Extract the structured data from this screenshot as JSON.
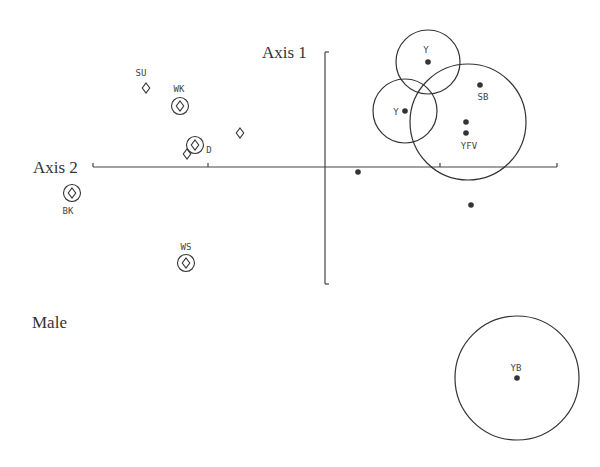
{
  "chart_data": {
    "type": "scatter",
    "title": "",
    "caption": "Male",
    "xlabel": "Axis 2",
    "ylabel": "Axis 1",
    "grid": false,
    "axes": {
      "horizontal": {
        "y": 167,
        "x_start": 93,
        "x_end": 557,
        "ticks": [
          93,
          208,
          440,
          557
        ]
      },
      "vertical": {
        "x": 325,
        "y_start": 52,
        "y_end": 284
      }
    },
    "series": [
      {
        "name": "diamond-markers",
        "marker": "diamond",
        "points": [
          {
            "label": "SU",
            "x": 146,
            "y": 88,
            "ringed": false,
            "label_pos": [
              141,
              76
            ]
          },
          {
            "label": "WK",
            "x": 180,
            "y": 106,
            "ringed": true,
            "label_pos": [
              179,
              92
            ]
          },
          {
            "label": "",
            "x": 240,
            "y": 133,
            "ringed": false
          },
          {
            "label": "D",
            "x": 195,
            "y": 145,
            "ringed": true,
            "label_pos": [
              209,
              153
            ]
          },
          {
            "label": "",
            "x": 187,
            "y": 154,
            "ringed": false
          },
          {
            "label": "BK",
            "x": 72,
            "y": 193,
            "ringed": true,
            "label_pos": [
              68,
              214
            ]
          },
          {
            "label": "WS",
            "x": 186,
            "y": 263,
            "ringed": true,
            "label_pos": [
              186,
              250
            ]
          }
        ]
      },
      {
        "name": "dot-markers",
        "marker": "filled-circle",
        "points": [
          {
            "label": "Y",
            "x": 428,
            "y": 62,
            "label_pos": [
              426,
              53
            ]
          },
          {
            "label": "Y",
            "x": 405,
            "y": 111,
            "label_pos": [
              396,
              115
            ]
          },
          {
            "label": "SB",
            "x": 480,
            "y": 85,
            "label_pos": [
              483,
              100
            ]
          },
          {
            "label": "",
            "x": 466,
            "y": 122
          },
          {
            "label": "YFV",
            "x": 466,
            "y": 133,
            "label_pos": [
              469,
              149
            ]
          },
          {
            "label": "",
            "x": 358,
            "y": 172
          },
          {
            "label": "",
            "x": 471,
            "y": 205
          },
          {
            "label": "YB",
            "x": 517,
            "y": 378,
            "label_pos": [
              516,
              371
            ]
          }
        ]
      }
    ],
    "confidence_circles": [
      {
        "center": [
          428,
          62
        ],
        "r": 32,
        "for": "Y (top)"
      },
      {
        "center": [
          405,
          111
        ],
        "r": 32,
        "for": "Y (left)"
      },
      {
        "center": [
          468,
          122
        ],
        "r": 58,
        "for": "SB/YFV group"
      },
      {
        "center": [
          517,
          378
        ],
        "r": 62,
        "for": "YB"
      }
    ]
  },
  "labels": {
    "axis1": "Axis 1",
    "axis2": "Axis 2",
    "caption": "Male"
  },
  "style": {
    "ink": "#333333"
  }
}
